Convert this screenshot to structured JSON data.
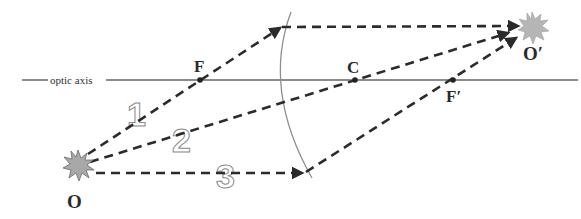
{
  "diagram": {
    "type": "concave-mirror-ray-diagram",
    "labels": {
      "object": "O",
      "image": "O′",
      "focal_point": "F",
      "focal_point_prime": "F′",
      "center": "C",
      "optic_axis": "optic axis"
    },
    "ray_numbers": [
      "1",
      "2",
      "3"
    ],
    "colors": {
      "ray": "#2b2b2b",
      "axis": "#8c8c8c",
      "mirror": "#8f8f8f",
      "object_fill": "#a8a8a8",
      "image_fill": "#b5b5b5",
      "number_outline": "#8a8a8a"
    },
    "points": {
      "object": [
        78,
        165
      ],
      "image": [
        532,
        28
      ],
      "F": [
        200,
        80
      ],
      "C": [
        355,
        80
      ],
      "F_prime": [
        453,
        80
      ]
    }
  }
}
